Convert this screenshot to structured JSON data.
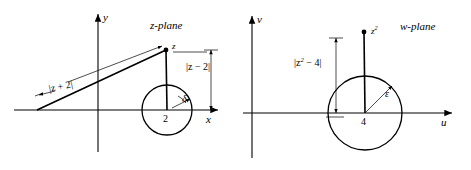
{
  "figure": {
    "type": "complex-plane-mapping-diagram",
    "background_color": "#ffffff",
    "stroke_color": "#000000",
    "width": 471,
    "height": 170
  },
  "z_plane": {
    "title": "z-plane",
    "x_axis_label": "x",
    "y_axis_label": "y",
    "point_label": "z",
    "center_label": "2",
    "angle_label": "δ",
    "distance_from_origin_left": "|z + 2|",
    "distance_from_center": "|z − 2|",
    "circle": {
      "center_x": 2,
      "radius_label": "δ"
    }
  },
  "w_plane": {
    "title": "w-plane",
    "x_axis_label": "u",
    "y_axis_label": "v",
    "point_label": "z",
    "point_label_exponent": "2",
    "center_label": "4",
    "radius_label": "ε",
    "distance_from_center": "|z",
    "distance_from_center_exponent": "2",
    "distance_from_center_tail": " − 4|",
    "circle": {
      "center_x": 4,
      "radius_label": "ε"
    }
  }
}
